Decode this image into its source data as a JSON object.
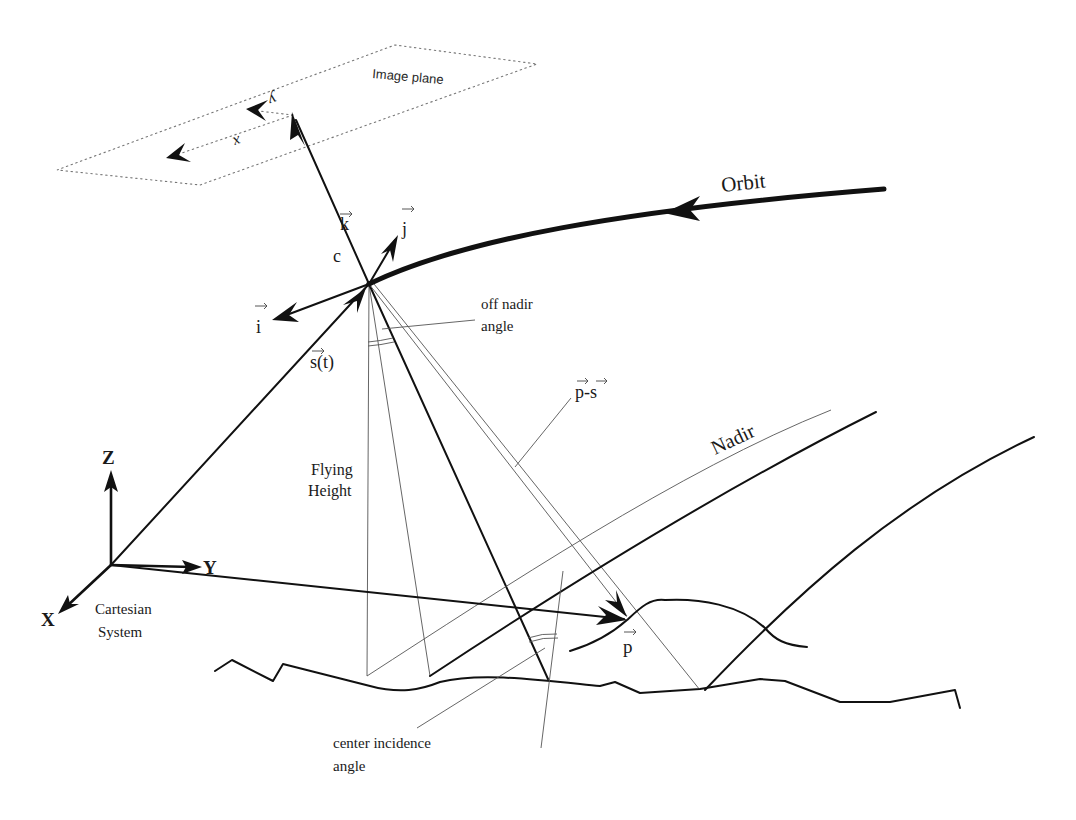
{
  "diagram": {
    "type": "satellite imaging geometry",
    "labels": {
      "image_plane": "Image plane",
      "image_x": "x",
      "image_y": "y",
      "vec_k": "k",
      "vec_j": "j",
      "vec_i": "i",
      "c": "c",
      "orbit": "Orbit",
      "off_nadir_line1": "off nadir",
      "off_nadir_line2": "angle",
      "s_t": "s(t)",
      "p_minus_s": "p-s",
      "nadir": "Nadir",
      "flying_line1": "Flying",
      "flying_line2": "Height",
      "axis_z": "Z",
      "axis_y": "Y",
      "axis_x": "X",
      "cartesian_line1": "Cartesian",
      "cartesian_line2": "System",
      "vec_p": "p",
      "center_incidence_line1": "center incidence",
      "center_incidence_line2": "angle"
    },
    "colors": {
      "ink": "#111111",
      "thin_line": "#555555",
      "background": "#ffffff"
    }
  }
}
